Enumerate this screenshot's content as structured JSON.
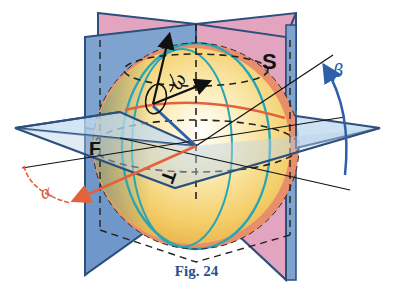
{
  "figure": {
    "caption": "Fig. 24",
    "labels": {
      "plane_s": "S",
      "plane_f": "F",
      "plane_t": "T",
      "omega": "ω",
      "alpha": "α",
      "beta": "β"
    },
    "colors": {
      "plane_blue": "#7fa3cf",
      "plane_blue_edge": "#2d4f7c",
      "plane_pink": "#e3a4bf",
      "plane_horizontal": "#c3dcf2",
      "sphere_light": "#fff7df",
      "sphere_mid": "#f6d77a",
      "sphere_dark": "#e9b44c",
      "sphere_rim_orange": "#e98e6b",
      "meridian_teal": "#2aa5b5",
      "orange_axis": "#e4613a",
      "blue_axis": "#2e5fa8",
      "caption": "#2a4f8c"
    }
  }
}
